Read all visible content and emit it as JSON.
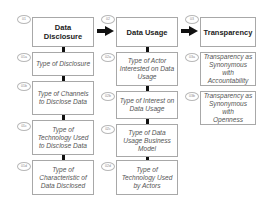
{
  "columns": [
    {
      "header": {
        "badge": "01",
        "label_line1": "Data",
        "label_line2": "Disclosure"
      },
      "items": [
        {
          "badge": "01a",
          "lines": [
            "Type of Disclosure"
          ]
        },
        {
          "badge": "01b",
          "lines": [
            "Type of Channels",
            "to Disclose Data"
          ]
        },
        {
          "badge": "01c",
          "lines": [
            "Type of",
            "Technology Used",
            "to Disclose Data"
          ]
        },
        {
          "badge": "01d",
          "lines": [
            "Type of",
            "Characteristic of",
            "Data Disclosed"
          ]
        }
      ]
    },
    {
      "header": {
        "badge": "02",
        "label_line1": "Data Usage",
        "label_line2": ""
      },
      "items": [
        {
          "badge": "02a",
          "lines": [
            "Type of Actor",
            "Interested on Data",
            "Usage"
          ]
        },
        {
          "badge": "02b",
          "lines": [
            "Type of Interest on",
            "Data Usage"
          ]
        },
        {
          "badge": "02c",
          "lines": [
            "Type of Data",
            "Usage Business",
            "Model"
          ]
        },
        {
          "badge": "02d",
          "lines": [
            "Type of",
            "Technology Used",
            "by Actors"
          ]
        }
      ]
    },
    {
      "header": {
        "badge": "03",
        "label_line1": "Transparency",
        "label_line2": ""
      },
      "items": [
        {
          "badge": "03a",
          "lines": [
            "Transparency as",
            "Synonymous with",
            "Accountability"
          ]
        },
        {
          "badge": "03b",
          "lines": [
            "Transparency as",
            "Synonymous with",
            "Openness"
          ]
        }
      ]
    }
  ],
  "arrows": [
    {
      "from": "Data Disclosure",
      "to": "Data Usage",
      "icon": "right-arrow-icon"
    },
    {
      "from": "Data Usage",
      "to": "Transparency",
      "icon": "right-arrow-icon"
    }
  ]
}
